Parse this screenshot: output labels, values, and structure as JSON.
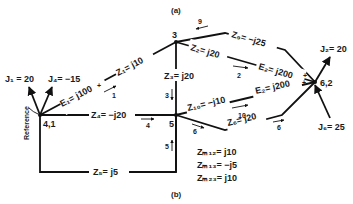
{
  "figure": {
    "caption_top": "(a)",
    "caption_bottom": "(b)"
  },
  "nodes": {
    "n41": "4,1",
    "n3": "3",
    "n5": "5",
    "n62": "6,2"
  },
  "reference_label": "Reference",
  "sources": {
    "J1": "J₁ = 20",
    "J4": "J₄= −15",
    "J2": "J₂= 20",
    "J6": "J₆= 25"
  },
  "elements": {
    "E1": "E₁= j100",
    "Z1": "Z₁= j10",
    "Z3": "Z₃= j20",
    "Z9": "Z₉= −j25",
    "Z2": "Z₂= j20",
    "E2a": "E₂= j200",
    "E2b": "E₂= j200",
    "Z10": "Z₁₀= −j10",
    "Z4": "Z₄= −j20",
    "Z6": "Z₆= j20",
    "Z5": "Z₅= j5"
  },
  "branch_numbers": {
    "b1": "1",
    "b2": "2",
    "b3": "3",
    "b4": "4",
    "b5": "5",
    "b6a": "6",
    "b6b": "6",
    "b9": "9",
    "b10": "10"
  },
  "polarity": {
    "plus": "+"
  },
  "mutuals": [
    "Z",
    "Z",
    "Z"
  ],
  "mutual_lines": {
    "m12": "Zₘ₁₂= j10",
    "m13": "Zₘ₁₃= −j5",
    "m23": "Zₘ₂₃= j10"
  }
}
